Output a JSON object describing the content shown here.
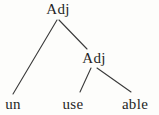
{
  "tree": {
    "type": "morphology-tree",
    "root": {
      "label": "Adj"
    },
    "inner": {
      "label": "Adj"
    },
    "leaves": {
      "un": {
        "label": "un"
      },
      "use": {
        "label": "use"
      },
      "able": {
        "label": "able"
      }
    },
    "edges": [
      {
        "from": "root",
        "to": "un"
      },
      {
        "from": "root",
        "to": "inner"
      },
      {
        "from": "inner",
        "to": "use"
      },
      {
        "from": "inner",
        "to": "able"
      }
    ]
  },
  "diagram": {
    "colors": {
      "background": "#fdfdfb",
      "text": "#262626",
      "line": "#3a3a3a"
    }
  }
}
